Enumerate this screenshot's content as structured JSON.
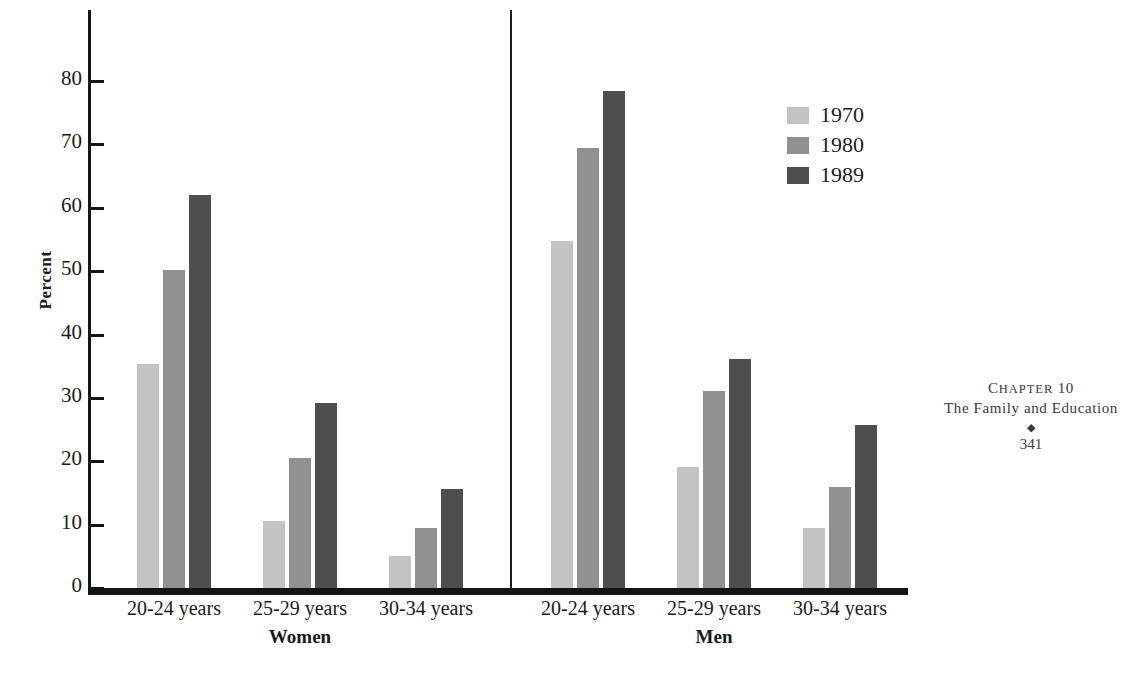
{
  "chart_data": {
    "type": "bar",
    "title": "",
    "xlabel": "",
    "ylabel": "Percent",
    "ylim": [
      0,
      85
    ],
    "yticks": [
      0,
      10,
      20,
      30,
      40,
      50,
      60,
      70,
      80
    ],
    "grid": false,
    "legend_position": "top-right",
    "legend": [
      "1970",
      "1980",
      "1989"
    ],
    "panels": [
      {
        "name": "Women",
        "categories": [
          "20-24 years",
          "25-29 years",
          "30-34 years"
        ],
        "series": [
          {
            "name": "1970",
            "values": [
              35.4,
              10.5,
              5.0
            ]
          },
          {
            "name": "1980",
            "values": [
              50.2,
              20.5,
              9.4
            ]
          },
          {
            "name": "1989",
            "values": [
              62.0,
              29.2,
              15.6
            ]
          }
        ]
      },
      {
        "name": "Men",
        "categories": [
          "20-24 years",
          "25-29 years",
          "30-34 years"
        ],
        "series": [
          {
            "name": "1970",
            "values": [
              54.8,
              19.1,
              9.5
            ]
          },
          {
            "name": "1980",
            "values": [
              69.4,
              31.1,
              15.9
            ]
          },
          {
            "name": "1989",
            "values": [
              78.5,
              36.2,
              25.7
            ]
          }
        ]
      }
    ],
    "colors": {
      "1970": "#c3c3c3",
      "1980": "#919191",
      "1989": "#4e4e4e",
      "axis": "#141414"
    }
  },
  "axis": {
    "ylabel": "Percent",
    "ticks": [
      "80",
      "70",
      "60",
      "50",
      "40",
      "30",
      "20",
      "10",
      "0"
    ]
  },
  "legend": {
    "items": [
      {
        "label": "1970",
        "swatch": "s1970"
      },
      {
        "label": "1980",
        "swatch": "s1980"
      },
      {
        "label": "1989",
        "swatch": "s1989"
      }
    ]
  },
  "panels": {
    "women": {
      "group_label": "Women",
      "categories": [
        "20-24 years",
        "25-29 years",
        "30-34 years"
      ]
    },
    "men": {
      "group_label": "Men",
      "categories": [
        "20-24 years",
        "25-29 years",
        "30-34 years"
      ]
    }
  },
  "running_head": {
    "chapter_word": "C",
    "chapter_rest": "HAPTER",
    "chapter_number": "10",
    "chapter_line": "Chapter 10",
    "title": "The Family and Education",
    "ornament": "◆",
    "folio": "341"
  }
}
